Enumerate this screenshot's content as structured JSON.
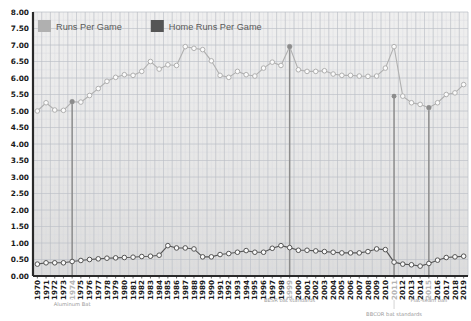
{
  "chart_data": {
    "type": "line",
    "title": "",
    "subtitle": "",
    "xlabel": "",
    "ylabel": "",
    "ylim": [
      0,
      8
    ],
    "ytick_step": 0.5,
    "grid": true,
    "legend_position": "top-left",
    "x": [
      1970,
      1971,
      1972,
      1973,
      1974,
      1975,
      1976,
      1977,
      1978,
      1979,
      1980,
      1981,
      1982,
      1983,
      1984,
      1985,
      1986,
      1987,
      1988,
      1989,
      1990,
      1991,
      1992,
      1993,
      1994,
      1995,
      1996,
      1997,
      1998,
      1999,
      2000,
      2001,
      2002,
      2003,
      2004,
      2005,
      2006,
      2007,
      2008,
      2009,
      2010,
      2011,
      2012,
      2013,
      2014,
      2015,
      2016,
      2017,
      2018,
      2019
    ],
    "yticks": [
      "0.00",
      "0.50",
      "1.00",
      "1.50",
      "2.00",
      "2.50",
      "3.00",
      "3.50",
      "4.00",
      "4.50",
      "5.00",
      "5.50",
      "6.00",
      "6.50",
      "7.00",
      "7.50",
      "8.00"
    ],
    "series": [
      {
        "name": "Runs Per Game",
        "color": "#b0b0b0",
        "marker": "open-circle",
        "values": [
          5.0,
          5.25,
          5.03,
          5.02,
          5.28,
          5.27,
          5.47,
          5.68,
          5.9,
          6.02,
          6.1,
          6.08,
          6.2,
          6.5,
          6.27,
          6.4,
          6.38,
          6.95,
          6.9,
          6.86,
          6.52,
          6.08,
          6.02,
          6.2,
          6.1,
          6.06,
          6.3,
          6.48,
          6.38,
          6.95,
          6.25,
          6.2,
          6.2,
          6.22,
          6.12,
          6.08,
          6.08,
          6.06,
          6.05,
          6.06,
          6.3,
          6.95,
          5.45,
          5.25,
          5.2,
          5.1,
          5.25,
          5.5,
          5.55,
          5.8
        ]
      },
      {
        "name": "Home Runs Per Game",
        "color": "#555555",
        "marker": "open-circle",
        "values": [
          0.36,
          0.4,
          0.4,
          0.4,
          0.44,
          0.47,
          0.5,
          0.52,
          0.54,
          0.55,
          0.56,
          0.57,
          0.59,
          0.6,
          0.63,
          0.92,
          0.85,
          0.85,
          0.82,
          0.58,
          0.58,
          0.65,
          0.68,
          0.72,
          0.77,
          0.72,
          0.72,
          0.84,
          0.92,
          0.86,
          0.78,
          0.78,
          0.76,
          0.74,
          0.72,
          0.7,
          0.7,
          0.7,
          0.74,
          0.82,
          0.8,
          0.42,
          0.36,
          0.34,
          0.3,
          0.38,
          0.48,
          0.56,
          0.58,
          0.6
        ]
      }
    ],
    "markers": [
      {
        "year": 1974,
        "label": "Aluminum Bat",
        "runs_value": 5.28,
        "hr_value": 0.44
      },
      {
        "year": 1999,
        "label": "BESR bat standards",
        "runs_value": 6.95,
        "hr_value": 0.86
      },
      {
        "year": 2011,
        "label": "BBCOR bat standards",
        "runs_value": 5.45,
        "hr_value": 0.42
      },
      {
        "year": 2015,
        "label": "Flat-seam ball",
        "runs_value": 5.1,
        "hr_value": 0.38
      }
    ]
  },
  "legend": {
    "items": [
      {
        "label": "Runs Per Game",
        "color": "#b0b0b0"
      },
      {
        "label": "Home Runs Per Game",
        "color": "#555555"
      }
    ]
  },
  "colors": {
    "runs": "#b0b0b0",
    "home_runs": "#555555",
    "marker_line": "#8c8c8c",
    "axis": "#2a2a2a",
    "grid_major": "#b9bdc4",
    "grid_minor": "#d6d9de",
    "plot_bg": "#e9e9e9",
    "page_bg": "#ffffff",
    "muted_text": "#b4b4b4"
  }
}
